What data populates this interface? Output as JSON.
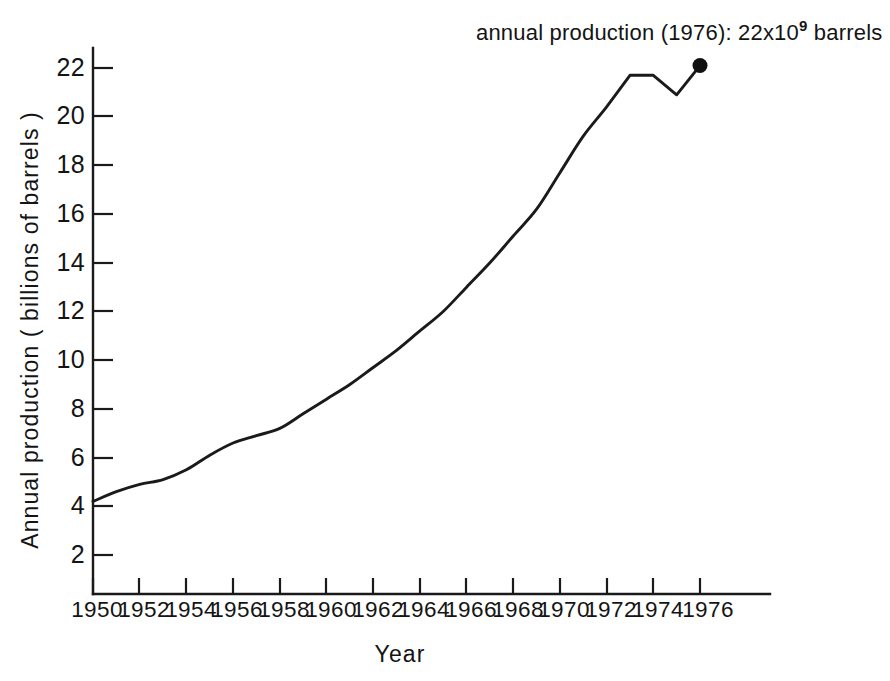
{
  "chart_data": {
    "type": "line",
    "title": "",
    "xlabel": "Year",
    "ylabel": "Annual production ( billions of barrels )",
    "xlim": [
      1949.2,
      1977.5
    ],
    "ylim": [
      0,
      23.2
    ],
    "grid": false,
    "legend": "none",
    "x_ticks": [
      "1950",
      "1952",
      "1954",
      "1956",
      "1958",
      "1960",
      "1962",
      "1964",
      "1966",
      "1968",
      "1970",
      "1972",
      "1974",
      "1976"
    ],
    "y_ticks": [
      "2",
      "4",
      "6",
      "8",
      "10",
      "12",
      "14",
      "16",
      "18",
      "20",
      "22"
    ],
    "x": [
      1950,
      1951,
      1952,
      1953,
      1954,
      1955,
      1956,
      1957,
      1958,
      1959,
      1960,
      1961,
      1962,
      1963,
      1964,
      1965,
      1966,
      1967,
      1968,
      1969,
      1970,
      1971,
      1972,
      1973,
      1974,
      1975,
      1976
    ],
    "values": [
      4.2,
      4.6,
      4.9,
      5.1,
      5.5,
      6.1,
      6.6,
      6.9,
      7.2,
      7.8,
      8.4,
      9.0,
      9.7,
      10.4,
      11.2,
      12.0,
      13.0,
      14.0,
      15.1,
      16.2,
      17.7,
      19.2,
      20.4,
      21.7,
      21.7,
      20.9,
      22.1
    ],
    "annotations": [
      {
        "name": "endpoint-annotation",
        "text_prefix": "annual production (1976): 22x10",
        "text_superscript": "9",
        "text_suffix": " barrels",
        "point_year": 1976,
        "point_value": 22.1
      }
    ],
    "marker_points": [
      {
        "x": 1976,
        "y": 22.1,
        "style": "filled-circle"
      }
    ],
    "line_color": "#1a1a1a",
    "axis_color": "#1a1a1a",
    "background_color": "#ffffff"
  }
}
